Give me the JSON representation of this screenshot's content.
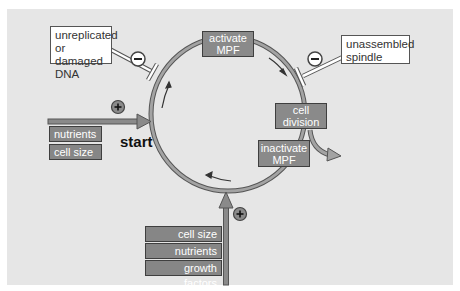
{
  "diagram": {
    "center_label": "start",
    "cycle_nodes": [
      {
        "id": "activate-mpf",
        "label_lines": [
          "activate",
          "MPF"
        ]
      },
      {
        "id": "cell-division",
        "label_lines": [
          "cell",
          "division"
        ]
      },
      {
        "id": "inactivate-mpf",
        "label_lines": [
          "inactivate",
          "MPF"
        ]
      }
    ],
    "inhibitors": [
      {
        "id": "dna-check",
        "label_lines": [
          "unreplicated",
          "or damaged",
          "DNA"
        ],
        "sign": "−"
      },
      {
        "id": "spindle-check",
        "label_lines": [
          "unassembled",
          "spindle"
        ],
        "sign": "−"
      }
    ],
    "positive_inputs": {
      "left": {
        "sign": "+",
        "items": [
          "nutrients",
          "cell size"
        ]
      },
      "bottom": {
        "sign": "+",
        "items": [
          "cell size",
          "nutrients",
          "growth factors"
        ]
      }
    },
    "colors": {
      "background": "#e6e6e6",
      "box_fill": "#8a8a8a",
      "ring": "#9a9a9a",
      "border": "#3f3f3f",
      "inhibitor_box": "#ffffff"
    }
  }
}
